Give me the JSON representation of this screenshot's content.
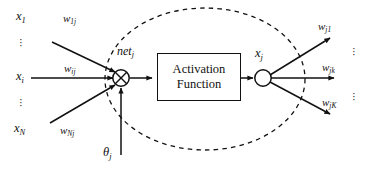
{
  "diagram": {
    "colors": {
      "stroke": "#111111",
      "background": "#ffffff"
    },
    "activation_box": {
      "line1": "Activation",
      "line2": "Function"
    },
    "nodes": {
      "summation": {
        "symbol": "circled-plus",
        "label": "net",
        "label_sub": "j"
      },
      "output": {
        "symbol": "circle",
        "label": "x",
        "label_sub": "j"
      }
    },
    "bias": {
      "label": "θ",
      "label_sub": "j"
    },
    "inputs": [
      {
        "label": "x",
        "label_sub": "1"
      },
      {
        "label": "x",
        "label_sub": "i"
      },
      {
        "label": "x",
        "label_sub": "N"
      }
    ],
    "input_weights": [
      {
        "label": "w",
        "label_sub": "1j"
      },
      {
        "label": "w",
        "label_sub": "ij"
      },
      {
        "label": "w",
        "label_sub": "Nj"
      }
    ],
    "output_weights": [
      {
        "label": "w",
        "label_sub": "j1"
      },
      {
        "label": "w",
        "label_sub": "jk"
      },
      {
        "label": "w",
        "label_sub": "jK"
      }
    ],
    "ellipsis": {
      "glyph": "·"
    },
    "boundary": {
      "style": "dashed-ellipse"
    }
  }
}
